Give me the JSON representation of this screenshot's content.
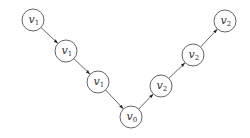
{
  "diagram": {
    "type": "directed-graph",
    "nodes": [
      {
        "id": "n1",
        "label": "v",
        "sub": "1",
        "x": 33,
        "y": 20
      },
      {
        "id": "n2",
        "label": "v",
        "sub": "1",
        "x": 66,
        "y": 51
      },
      {
        "id": "n3",
        "label": "v",
        "sub": "1",
        "x": 98,
        "y": 82
      },
      {
        "id": "n4",
        "label": "v",
        "sub": "0",
        "x": 131,
        "y": 117
      },
      {
        "id": "n5",
        "label": "v",
        "sub": "2",
        "x": 161,
        "y": 86
      },
      {
        "id": "n6",
        "label": "v",
        "sub": "2",
        "x": 193,
        "y": 55
      },
      {
        "id": "n7",
        "label": "v",
        "sub": "2",
        "x": 225,
        "y": 21
      }
    ],
    "edges": [
      {
        "from": "n1",
        "to": "n2"
      },
      {
        "from": "n2",
        "to": "n3"
      },
      {
        "from": "n3",
        "to": "n4"
      },
      {
        "from": "n4",
        "to": "n5"
      },
      {
        "from": "n5",
        "to": "n6"
      },
      {
        "from": "n6",
        "to": "n7"
      }
    ],
    "node_radius": 11,
    "colors": {
      "stroke": "#555555",
      "fill": "#ffffff",
      "text": "#333333"
    }
  }
}
